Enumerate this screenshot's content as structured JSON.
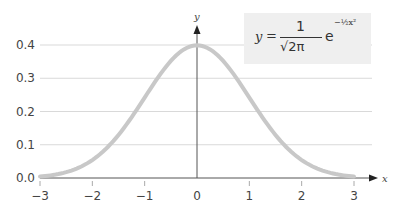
{
  "chart_data": {
    "type": "line",
    "title": "",
    "formula": {
      "lhs": "y",
      "eq": "=",
      "numerator": "1",
      "denominator": "√2π",
      "base": "e",
      "exponent": "−½x²"
    },
    "xlabel": "x",
    "ylabel": "y",
    "xlim": [
      -3,
      3
    ],
    "ylim": [
      0,
      0.4
    ],
    "x_ticks": [
      "−3",
      "−2",
      "−1",
      "0",
      "1",
      "2",
      "3"
    ],
    "y_ticks": [
      "0.0",
      "0.1",
      "0.2",
      "0.3",
      "0.4"
    ],
    "grid": "horizontal",
    "series": [
      {
        "name": "standard normal pdf",
        "color": "#c8c8c8",
        "x": [
          -3,
          -2.5,
          -2,
          -1.5,
          -1,
          -0.5,
          0,
          0.5,
          1,
          1.5,
          2,
          2.5,
          3
        ],
        "values": [
          0.0044,
          0.0175,
          0.054,
          0.1295,
          0.242,
          0.3521,
          0.3989,
          0.3521,
          0.242,
          0.1295,
          0.054,
          0.0175,
          0.0044
        ]
      }
    ]
  }
}
